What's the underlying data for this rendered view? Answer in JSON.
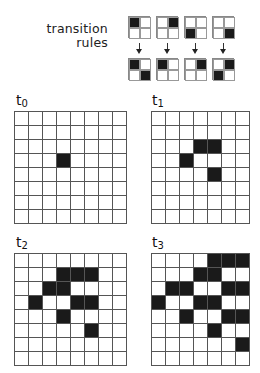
{
  "title": {
    "line1": "transition",
    "line2": "rules"
  },
  "rules": [
    {
      "before": [
        1,
        0,
        0,
        0
      ],
      "after": [
        1,
        0,
        0,
        1
      ]
    },
    {
      "before": [
        0,
        1,
        0,
        0
      ],
      "after": [
        1,
        0,
        0,
        0
      ]
    },
    {
      "before": [
        0,
        0,
        1,
        0
      ],
      "after": [
        0,
        1,
        0,
        0
      ]
    },
    {
      "before": [
        0,
        0,
        0,
        1
      ],
      "after": [
        0,
        1,
        1,
        0
      ]
    }
  ],
  "grids": [
    {
      "label": "t",
      "sub": "0",
      "cols": 8,
      "rows": 8,
      "filled": [
        [
          3,
          3
        ]
      ]
    },
    {
      "label": "t",
      "sub": "1",
      "cols": 7,
      "rows": 8,
      "filled": [
        [
          2,
          3
        ],
        [
          2,
          4
        ],
        [
          3,
          2
        ],
        [
          4,
          4
        ]
      ]
    },
    {
      "label": "t",
      "sub": "2",
      "cols": 8,
      "rows": 8,
      "filled": [
        [
          1,
          3
        ],
        [
          1,
          4
        ],
        [
          1,
          5
        ],
        [
          2,
          2
        ],
        [
          2,
          3
        ],
        [
          3,
          1
        ],
        [
          3,
          4
        ],
        [
          3,
          5
        ],
        [
          4,
          3
        ],
        [
          5,
          5
        ]
      ]
    },
    {
      "label": "t",
      "sub": "3",
      "cols": 7,
      "rows": 8,
      "filled": [
        [
          0,
          4
        ],
        [
          0,
          5
        ],
        [
          0,
          6
        ],
        [
          1,
          3
        ],
        [
          1,
          4
        ],
        [
          2,
          1
        ],
        [
          2,
          2
        ],
        [
          2,
          5
        ],
        [
          2,
          6
        ],
        [
          3,
          0
        ],
        [
          3,
          3
        ],
        [
          3,
          4
        ],
        [
          4,
          2
        ],
        [
          4,
          5
        ],
        [
          4,
          6
        ],
        [
          5,
          4
        ],
        [
          6,
          6
        ]
      ]
    }
  ],
  "colors": {
    "filled": "#1a1a1a",
    "empty": "#ffffff",
    "grid_line": "#555555"
  }
}
